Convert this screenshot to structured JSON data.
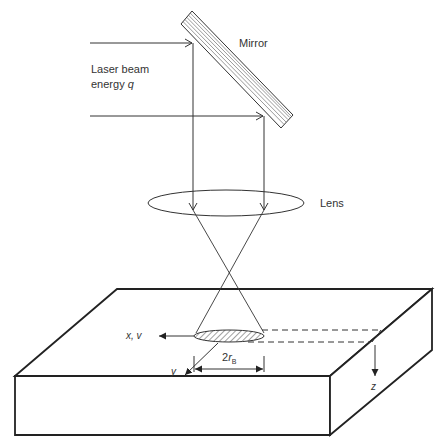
{
  "labels": {
    "mirror": "Mirror",
    "laser_line1": "Laser beam",
    "laser_line2_prefix": "energy ",
    "laser_line2_var": "q",
    "lens": "Lens",
    "x_axis": "x, v",
    "y_axis": "y",
    "z_axis": "z",
    "spot_diameter_prefix": "2",
    "spot_diameter_var": "r",
    "spot_diameter_sub": "B"
  },
  "colors": {
    "stroke": "#333333",
    "background": "#ffffff"
  }
}
